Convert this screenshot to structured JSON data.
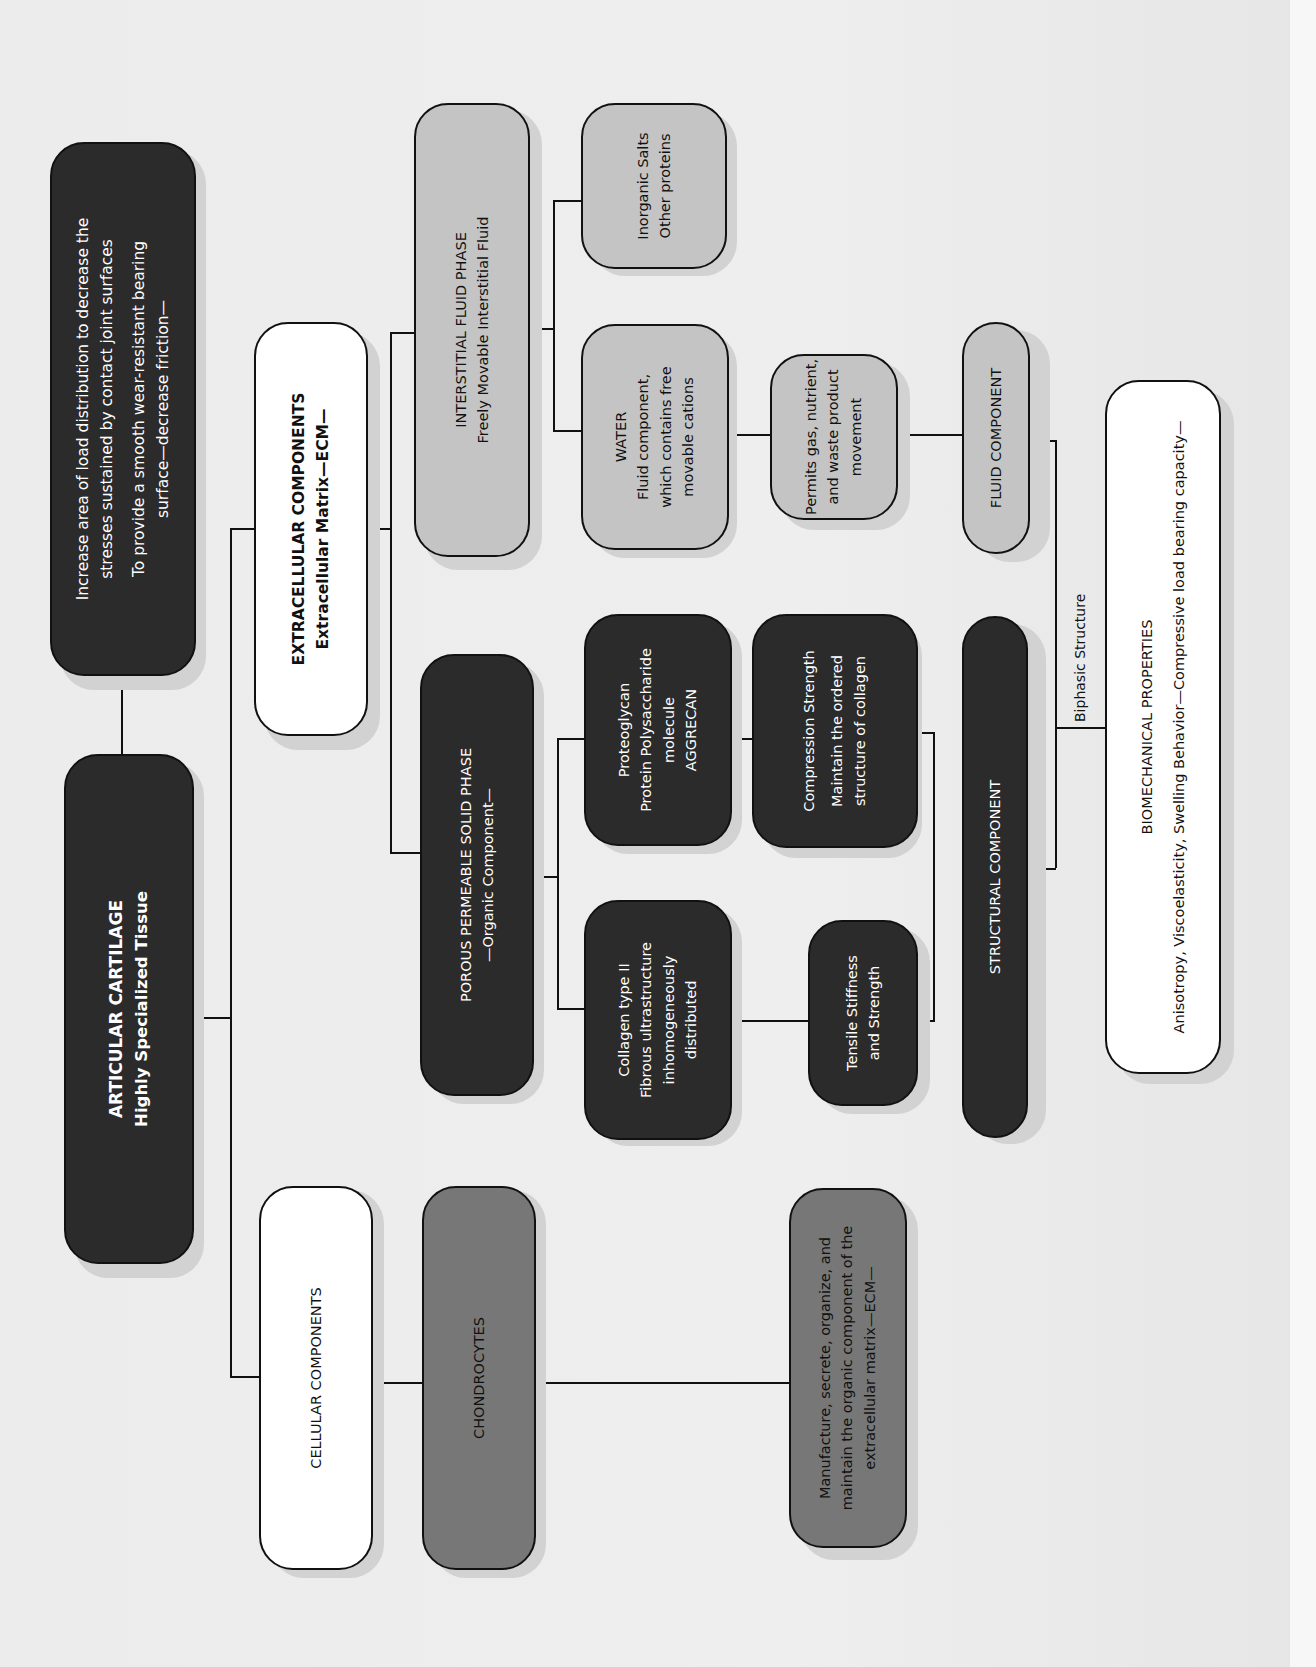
{
  "diagram": {
    "title": "ARTICULAR CARTILAGE",
    "subtitle": "Highly Specialized Tissue",
    "functions": {
      "line1": "Increase area of load distribution to decrease the",
      "line2": "stresses sustained by contact joint surfaces",
      "line3": "To provide a smooth wear-resistant bearing",
      "line4": "surface—decrease friction—"
    },
    "cellular": {
      "label": "CELLULAR COMPONENTS",
      "chondrocytes": "CHONDROCYTES",
      "role": {
        "line1": "Manufacture, secrete, organize, and",
        "line2": "maintain the organic component of the",
        "line3": "extracellular matrix—ECM—"
      }
    },
    "extracellular": {
      "label": "EXTRACELLULAR COMPONENTS",
      "sublabel": "Extracellular Matrix—ECM—"
    },
    "solid_phase": {
      "label": "POROUS PERMEABLE SOLID PHASE",
      "sublabel": "—Organic Component—",
      "collagen": {
        "line1": "Collagen type II",
        "line2": "Fibrous ultrastructure",
        "line3": "inhomogeneously",
        "line4": "distributed"
      },
      "proteoglycan": {
        "line1": "Proteoglycan",
        "line2": "Protein Polysaccharide",
        "line3": "molecule",
        "line4": "AGGRECAN"
      },
      "tensile": {
        "line1": "Tensile Stiffness",
        "line2": "and Strength"
      },
      "compression": {
        "line1": "Compression Strength",
        "line2": "Maintain the ordered",
        "line3": "structure of collagen"
      },
      "structural": "STRUCTURAL COMPONENT"
    },
    "fluid_phase": {
      "label": "INTERSTITIAL FLUID PHASE",
      "sublabel": "Freely Movable Interstitial Fluid",
      "water": {
        "line1": "WATER",
        "line2": "Fluid component,",
        "line3": "which contains free",
        "line4": "movable cations"
      },
      "salts": {
        "line1": "Inorganic Salts",
        "line2": "Other proteins"
      },
      "permits": {
        "line1": "Permits gas, nutrient,",
        "line2": "and waste product",
        "line3": "movement"
      },
      "fluid_component": "FLUID COMPONENT"
    },
    "biphasic_label": "Biphasic Structure",
    "biomechanical": {
      "label": "BIOMECHANICAL PROPERTIES",
      "sublabel": "Anisotropy, Viscoelasticity, Swelling Behavior—Compressive load bearing capacity—"
    }
  },
  "colors": {
    "dark": "#2b2b2b",
    "mid": "#777777",
    "light": "#c4c4c4",
    "white": "#ffffff",
    "line": "#111111"
  }
}
